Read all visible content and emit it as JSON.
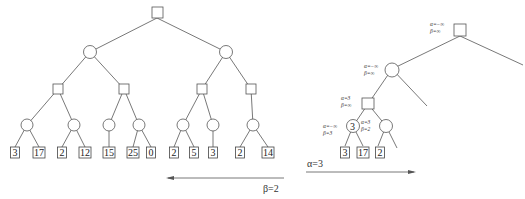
{
  "left_tree": {
    "root": {
      "type": "max"
    },
    "leaves": [
      "3",
      "17",
      "2",
      "12",
      "15",
      "25",
      "0",
      "2",
      "5",
      "3",
      "2",
      "14"
    ],
    "arrow_label": "β=2",
    "arrow_direction": "left"
  },
  "right_tree": {
    "annotations": {
      "root": [
        "α=−∞",
        "β=∞"
      ],
      "level1": [
        "α=−∞",
        "β=∞"
      ],
      "level2": [
        "α=3",
        "β=∞"
      ],
      "level3_left": [
        "α=−∞",
        "β=3"
      ],
      "level3_right": [
        "α=3",
        "β=2"
      ]
    },
    "level3_left_value": "3",
    "leaves": [
      "3",
      "17",
      "2"
    ],
    "arrow_label": "α=3",
    "arrow_direction": "right"
  },
  "colors": {
    "stroke": "#555555",
    "background": "#ffffff"
  }
}
